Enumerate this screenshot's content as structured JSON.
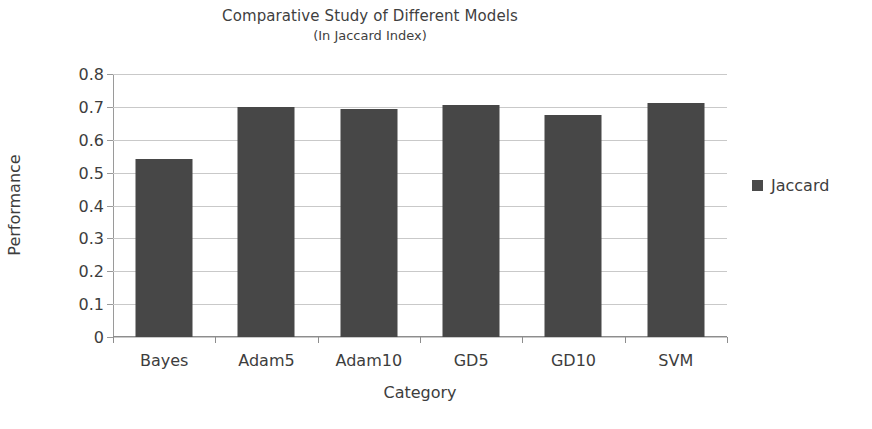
{
  "chart_data": {
    "type": "bar",
    "title": "Comparative Study of Different Models",
    "subtitle": "(In Jaccard Index)",
    "xlabel": "Category",
    "ylabel": "Performance",
    "categories": [
      "Bayes",
      "Adam5",
      "Adam10",
      "GD5",
      "GD10",
      "SVM"
    ],
    "series": [
      {
        "name": "Jaccard",
        "values": [
          0.54,
          0.7,
          0.695,
          0.705,
          0.675,
          0.712
        ],
        "color": "#474747"
      }
    ],
    "ylim": [
      0,
      0.8
    ],
    "ytick_values": [
      0,
      0.1,
      0.2,
      0.3,
      0.4,
      0.5,
      0.6,
      0.7,
      0.8
    ],
    "ytick_labels": [
      "0",
      "0.1",
      "0.2",
      "0.3",
      "0.4",
      "0.5",
      "0.6",
      "0.7",
      "0.8"
    ],
    "grid": "horizontal",
    "legend_position": "right",
    "legend_entries": [
      "Jaccard"
    ]
  },
  "colors": {
    "bar": "#474747",
    "grid": "#c9c9c9",
    "axis": "#8d8d8d",
    "text": "#3d3d3d",
    "background": "#ffffff"
  }
}
